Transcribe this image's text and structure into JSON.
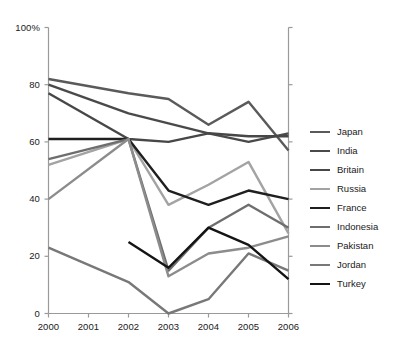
{
  "chart_data": {
    "type": "line",
    "title": "",
    "xlabel": "",
    "ylabel": "",
    "categories": [
      2000,
      2001,
      2002,
      2003,
      2004,
      2005,
      2006
    ],
    "x": [
      2000,
      2001,
      2002,
      2003,
      2004,
      2005,
      2006
    ],
    "xlim": [
      2000,
      2006
    ],
    "ylim": [
      0,
      100
    ],
    "grid": false,
    "legend_position": "right",
    "y_ticks": [
      0,
      20,
      40,
      60,
      80,
      100
    ],
    "y_tick_labels": [
      "0",
      "20",
      "40",
      "60",
      "80",
      "100%"
    ],
    "x_tick_labels": [
      "2000",
      "2001",
      "2002",
      "2003",
      "2004",
      "2005",
      "2006"
    ],
    "series": [
      {
        "name": "Japan",
        "color": "#5a5a5a",
        "x": [
          2000,
          2002,
          2003,
          2004,
          2005,
          2006
        ],
        "values": [
          82,
          77,
          75,
          66,
          74,
          57
        ]
      },
      {
        "name": "India",
        "color": "#4a4a4a",
        "x": [
          2000,
          2002,
          2004,
          2005,
          2006
        ],
        "values": [
          80,
          70,
          63,
          60,
          63
        ]
      },
      {
        "name": "Britain",
        "color": "#474747",
        "x": [
          2000,
          2002,
          2003,
          2004,
          2005,
          2006
        ],
        "values": [
          77,
          61,
          60,
          63,
          62,
          62
        ]
      },
      {
        "name": "Russia",
        "color": "#a3a3a3",
        "x": [
          2000,
          2002,
          2003,
          2004,
          2005,
          2006
        ],
        "values": [
          52,
          61,
          38,
          45,
          53,
          28
        ]
      },
      {
        "name": "France",
        "color": "#1f1f1f",
        "x": [
          2000,
          2002,
          2003,
          2004,
          2005,
          2006
        ],
        "values": [
          61,
          61,
          43,
          38,
          43,
          40
        ]
      },
      {
        "name": "Indonesia",
        "color": "#6e6e6e",
        "x": [
          2000,
          2002,
          2003,
          2004,
          2005,
          2006
        ],
        "values": [
          54,
          61,
          15,
          30,
          38,
          30
        ]
      },
      {
        "name": "Pakistan",
        "color": "#8c8c8c",
        "x": [
          2000,
          2002,
          2003,
          2004,
          2005,
          2006
        ],
        "values": [
          40,
          61,
          13,
          21,
          23,
          27
        ]
      },
      {
        "name": "Jordan",
        "color": "#787878",
        "x": [
          2000,
          2002,
          2003,
          2004,
          2005,
          2006
        ],
        "values": [
          23,
          11,
          0,
          5,
          21,
          15
        ]
      },
      {
        "name": "Turkey",
        "color": "#141414",
        "x": [
          2002,
          2003,
          2004,
          2005,
          2006
        ],
        "values": [
          25,
          16,
          30,
          24,
          12
        ]
      }
    ]
  },
  "axis": {
    "frame_color": "#9a9a9a"
  },
  "legend": {
    "entries": [
      {
        "label": "Japan"
      },
      {
        "label": "India"
      },
      {
        "label": "Britain"
      },
      {
        "label": "Russia"
      },
      {
        "label": "France"
      },
      {
        "label": "Indonesia"
      },
      {
        "label": "Pakistan"
      },
      {
        "label": "Jordan"
      },
      {
        "label": "Turkey"
      }
    ]
  }
}
